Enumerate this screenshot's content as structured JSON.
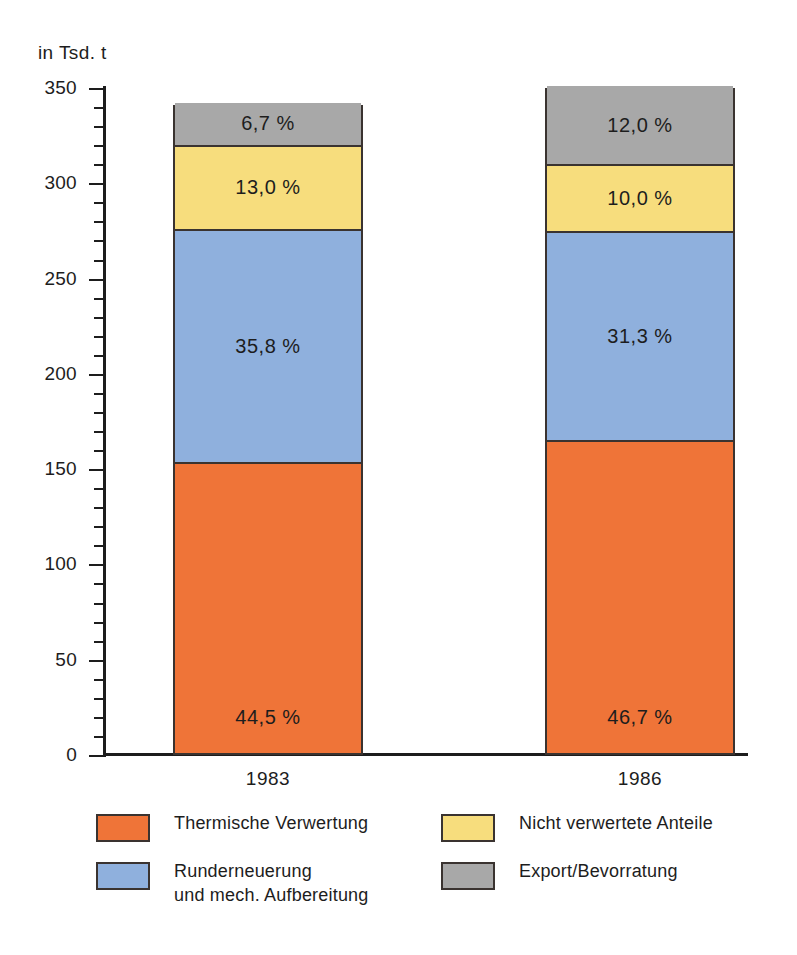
{
  "axis": {
    "unit_label": "in Tsd. t",
    "y_ticks": [
      "0",
      "50",
      "100",
      "150",
      "200",
      "250",
      "300",
      "350"
    ],
    "y_min": 0,
    "y_max": 350,
    "y_major_step": 50,
    "y_minor_step": 10
  },
  "categories": [
    "1983",
    "1986"
  ],
  "legend": [
    {
      "label": "Thermische Verwertung",
      "color": "#ef7438",
      "key": "thermische-verwertung"
    },
    {
      "label": "Nicht verwertete Anteile",
      "color": "#f7dd7d",
      "key": "nicht-verwertete-anteile"
    },
    {
      "label": "Runderneuerung\nund mech. Aufbereitung",
      "color": "#8fb0dd",
      "key": "runderneuerung-aufbereitung"
    },
    {
      "label": "Export/Bevorratung",
      "color": "#a8a8a8",
      "key": "export-bevorratung"
    }
  ],
  "bars": [
    {
      "category": "1983",
      "total": 341,
      "segments": [
        {
          "name": "Thermische Verwertung",
          "label": "44,5 %",
          "percent": 44.5,
          "value": 152,
          "color": "#ef7438"
        },
        {
          "name": "Runderneuerung und mech. Aufbereitung",
          "label": "35,8 %",
          "percent": 35.8,
          "value": 122,
          "color": "#8fb0dd"
        },
        {
          "name": "Nicht verwertete Anteile",
          "label": "13,0 %",
          "percent": 13.0,
          "value": 44,
          "color": "#f7dd7d"
        },
        {
          "name": "Export/Bevorratung",
          "label": "6,7 %",
          "percent": 6.7,
          "value": 23,
          "color": "#a8a8a8"
        }
      ]
    },
    {
      "category": "1986",
      "total": 350,
      "segments": [
        {
          "name": "Thermische Verwertung",
          "label": "46,7 %",
          "percent": 46.7,
          "value": 163,
          "color": "#ef7438"
        },
        {
          "name": "Runderneuerung und mech. Aufbereitung",
          "label": "31,3 %",
          "percent": 31.3,
          "value": 110,
          "color": "#8fb0dd"
        },
        {
          "name": "Nicht verwertete Anteile",
          "label": "10,0 %",
          "percent": 10.0,
          "value": 35,
          "color": "#f7dd7d"
        },
        {
          "name": "Export/Bevorratung",
          "label": "12,0 %",
          "percent": 12.0,
          "value": 42,
          "color": "#a8a8a8"
        }
      ]
    }
  ],
  "chart_data": {
    "type": "bar",
    "subtype": "stacked",
    "title": "",
    "subtitle": "",
    "xlabel": "",
    "ylabel": "in Tsd. t",
    "ylim": [
      0,
      350
    ],
    "grid": false,
    "legend_position": "bottom",
    "categories": [
      "1983",
      "1986"
    ],
    "series": [
      {
        "name": "Thermische Verwertung",
        "color": "#ef7438",
        "values": [
          152,
          163
        ],
        "percent": [
          44.5,
          46.7
        ],
        "labels": [
          "44,5 %",
          "46,7 %"
        ]
      },
      {
        "name": "Runderneuerung und mech. Aufbereitung",
        "color": "#8fb0dd",
        "values": [
          122,
          110
        ],
        "percent": [
          35.8,
          31.3
        ],
        "labels": [
          "35,8 %",
          "31,3 %"
        ]
      },
      {
        "name": "Nicht verwertete Anteile",
        "color": "#f7dd7d",
        "values": [
          44,
          35
        ],
        "percent": [
          13.0,
          10.0
        ],
        "labels": [
          "13,0 %",
          "10,0 %"
        ]
      },
      {
        "name": "Export/Bevorratung",
        "color": "#a8a8a8",
        "values": [
          23,
          42
        ],
        "percent": [
          6.7,
          12.0
        ],
        "labels": [
          "6,7 %",
          "12,0 %"
        ]
      }
    ],
    "totals": [
      341,
      350
    ],
    "yticks": [
      0,
      50,
      100,
      150,
      200,
      250,
      300,
      350
    ],
    "ytick_labels": [
      "0",
      "50",
      "100",
      "150",
      "200",
      "250",
      "300",
      "350"
    ],
    "minor_tick_step": 10
  }
}
